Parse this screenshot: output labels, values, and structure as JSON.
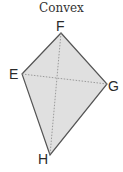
{
  "title": "Convex",
  "shape": {
    "type": "quadrilateral",
    "fill": "#e0e0e0",
    "stroke": "#555555",
    "diagonal_style": "dotted",
    "vertices": [
      {
        "label": "F",
        "x": 61,
        "y": 33
      },
      {
        "label": "G",
        "x": 107,
        "y": 84
      },
      {
        "label": "H",
        "x": 50,
        "y": 155
      },
      {
        "label": "E",
        "x": 22,
        "y": 74
      }
    ],
    "diagonals": [
      [
        "E",
        "G"
      ],
      [
        "F",
        "H"
      ]
    ]
  },
  "labels": {
    "F": "F",
    "E": "E",
    "G": "G",
    "H": "H"
  }
}
